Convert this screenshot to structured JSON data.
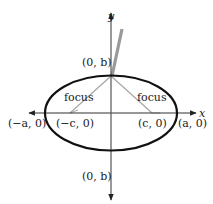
{
  "diagram": {
    "type": "ellipse-with-foci",
    "axes": {
      "x_label": "x",
      "y_label": "y"
    },
    "labels": {
      "top_vertex": "(0, b)",
      "bottom_vertex": "(0, b)",
      "left_vertex": "(−a, 0)",
      "right_vertex": "(a, 0)",
      "left_focus_point": "(−c, 0)",
      "right_focus_point": "(c, 0)",
      "left_focus_text": "focus",
      "right_focus_text": "focus"
    },
    "colors": {
      "ellipse": "#111111",
      "axes": "#333333",
      "focus_lines": "#a0a0a0",
      "rod": "#9a9a9a"
    }
  }
}
